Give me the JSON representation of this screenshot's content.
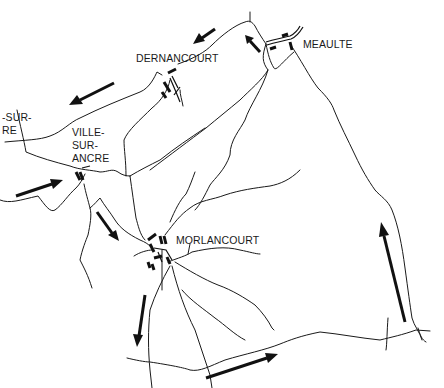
{
  "map": {
    "title": "",
    "colors": {
      "background": "#ffffff",
      "ink": "#111111"
    },
    "places": [
      {
        "id": "dernancourt",
        "name": "DERNANCOURT",
        "x": 136,
        "y": 52
      },
      {
        "id": "meaulte",
        "name": "MEAULTE",
        "x": 303,
        "y": 38
      },
      {
        "id": "ville-sur-ancre",
        "name": "VILLE-\nSUR-\nANCRE",
        "x": 72,
        "y": 126
      },
      {
        "id": "buire-sur-ancre",
        "name": "-SUR-\nRE",
        "x": 2,
        "y": 111
      },
      {
        "id": "morlancourt",
        "name": "MORLANCOURT",
        "x": 176,
        "y": 234
      }
    ],
    "arrows": [
      {
        "id": "arrow-toward-dernancourt",
        "direction": "southwest",
        "from": [
          215,
          31
        ],
        "to": [
          194,
          43
        ]
      },
      {
        "id": "arrow-west-of-dernancourt",
        "direction": "southwest",
        "from": [
          114,
          84
        ],
        "to": [
          70,
          104
        ]
      },
      {
        "id": "arrow-into-meaulte",
        "direction": "northwest",
        "from": [
          259,
          52
        ],
        "to": [
          246,
          36
        ]
      },
      {
        "id": "arrow-into-ville-sur-ancre",
        "direction": "east",
        "from": [
          16,
          195
        ],
        "to": [
          62,
          181
        ]
      },
      {
        "id": "arrow-toward-morlancourt",
        "direction": "southeast",
        "from": [
          97,
          212
        ],
        "to": [
          118,
          240
        ]
      },
      {
        "id": "arrow-south-of-morlancourt",
        "direction": "south",
        "from": [
          144,
          295
        ],
        "to": [
          136,
          345
        ]
      },
      {
        "id": "arrow-southeast-road",
        "direction": "east",
        "from": [
          206,
          377
        ],
        "to": [
          278,
          353
        ]
      },
      {
        "id": "arrow-east-side-north",
        "direction": "north",
        "from": [
          404,
          322
        ],
        "to": [
          381,
          222
        ]
      }
    ]
  }
}
